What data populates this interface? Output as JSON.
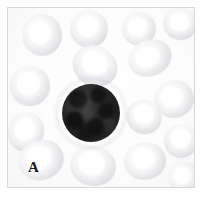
{
  "figure": {
    "panel_label": "A",
    "domain": "light-microscopy-blood-smear",
    "frame_color": "#d9d9dc",
    "background_color": "#ffffff"
  },
  "micrograph": {
    "field_background": "#fdfdfd",
    "erythrocyte_color": "#e2e2e6",
    "erythrocyte_center_color": "#ffffff",
    "leukocyte_color": "#262626",
    "leukocyte_halo_color": "#b2b2b8",
    "erythrocytes": [
      {
        "name": "rbc-top-left",
        "left": 14,
        "top": 6,
        "width": 40,
        "height": 42,
        "rotate": -8
      },
      {
        "name": "rbc-top-center",
        "left": 62,
        "top": 2,
        "width": 38,
        "height": 38,
        "rotate": 12
      },
      {
        "name": "rbc-top-right",
        "left": 114,
        "top": 4,
        "width": 34,
        "height": 34,
        "rotate": -5
      },
      {
        "name": "rbc-top-far-right",
        "left": 155,
        "top": 0,
        "width": 34,
        "height": 32,
        "rotate": 18
      },
      {
        "name": "rbc-upper-mid",
        "left": 64,
        "top": 38,
        "width": 46,
        "height": 40,
        "rotate": 28
      },
      {
        "name": "rbc-upper-right",
        "left": 120,
        "top": 32,
        "width": 44,
        "height": 36,
        "rotate": -22
      },
      {
        "name": "rbc-left-upper",
        "left": 2,
        "top": 58,
        "width": 40,
        "height": 40,
        "rotate": 4
      },
      {
        "name": "rbc-right-mid",
        "left": 146,
        "top": 72,
        "width": 40,
        "height": 38,
        "rotate": -12
      },
      {
        "name": "rbc-left-mid",
        "left": 0,
        "top": 104,
        "width": 36,
        "height": 40,
        "rotate": 16
      },
      {
        "name": "rbc-right-upper-mid",
        "left": 118,
        "top": 92,
        "width": 36,
        "height": 34,
        "rotate": 30
      },
      {
        "name": "rbc-bottom-left",
        "left": 10,
        "top": 132,
        "width": 46,
        "height": 40,
        "rotate": -18
      },
      {
        "name": "rbc-bottom-center",
        "left": 62,
        "top": 138,
        "width": 46,
        "height": 40,
        "rotate": 10
      },
      {
        "name": "rbc-bottom-right",
        "left": 116,
        "top": 134,
        "width": 42,
        "height": 38,
        "rotate": -6
      },
      {
        "name": "rbc-right-lower",
        "left": 156,
        "top": 116,
        "width": 34,
        "height": 34,
        "rotate": 22
      },
      {
        "name": "rbc-bottom-far-right",
        "left": 160,
        "top": 154,
        "width": 32,
        "height": 30,
        "rotate": -14
      }
    ],
    "leukocyte": {
      "name": "leukocyte-nucleus",
      "left": 54,
      "top": 76,
      "width": 58,
      "height": 58
    }
  }
}
